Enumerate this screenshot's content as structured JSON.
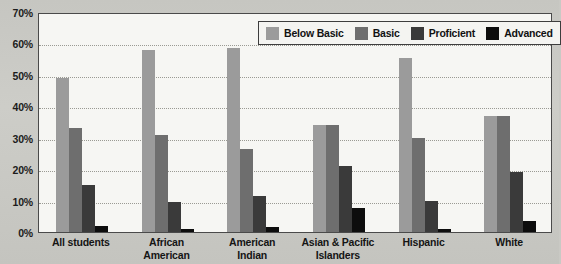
{
  "chart_data": {
    "type": "bar",
    "title": "",
    "xlabel": "",
    "ylabel": "",
    "ylim": [
      0,
      70
    ],
    "ytick_labels": [
      "0%",
      "10%",
      "20%",
      "30%",
      "40%",
      "50%",
      "60%",
      "70%"
    ],
    "ytick_values": [
      0,
      10,
      20,
      30,
      40,
      50,
      60,
      70
    ],
    "grid": true,
    "legend_position": "top-right",
    "categories": [
      "All students",
      "African American",
      "American Indian",
      "Asian & Pacific Islanders",
      "Hispanic",
      "White"
    ],
    "category_lines": [
      [
        "All students"
      ],
      [
        "African",
        "American"
      ],
      [
        "American",
        "Indian"
      ],
      [
        "Asian & Pacific",
        "Islanders"
      ],
      [
        "Hispanic"
      ],
      [
        "White"
      ]
    ],
    "series": [
      {
        "name": "Below Basic",
        "color": "#9b9b9b",
        "values": [
          49,
          58,
          58.5,
          34,
          55.5,
          37
        ]
      },
      {
        "name": "Basic",
        "color": "#6e6e6e",
        "values": [
          33,
          31,
          26.5,
          34,
          30,
          37
        ]
      },
      {
        "name": "Proficient",
        "color": "#3a3a3a",
        "values": [
          15,
          9.5,
          11.5,
          21,
          10,
          19
        ]
      },
      {
        "name": "Advanced",
        "color": "#0d0d0d",
        "values": [
          2,
          1,
          1.5,
          7.5,
          1,
          3.5
        ]
      }
    ]
  },
  "colors": {
    "page_background": "#c9c9c4",
    "plot_background": "#f6f6f3",
    "plot_border": "#4a4a4a",
    "gridline": "#9a9a93",
    "text": "#151515"
  }
}
